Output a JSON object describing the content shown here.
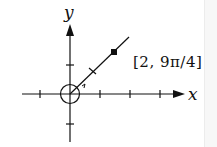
{
  "diagram": {
    "type": "polar-coordinate-plot",
    "x_axis_label": "x",
    "y_axis_label": "y",
    "point_label": "[2, 9π/4]",
    "point": {
      "r": 2,
      "theta": "9π/4"
    },
    "colors": {
      "stroke": "#111111",
      "background": "#ffffff"
    }
  }
}
